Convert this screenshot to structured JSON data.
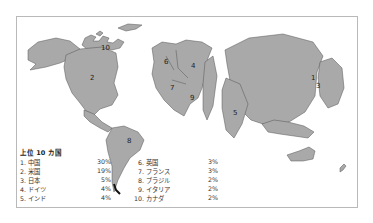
{
  "map": {
    "type": "cartogram",
    "fill_color": "#a9a9a9",
    "border_color": "#b9b9b9",
    "region_labels": [
      {
        "rank": "1",
        "country": "中国"
      },
      {
        "rank": "2",
        "country": "米国"
      },
      {
        "rank": "3",
        "country": "日本"
      },
      {
        "rank": "4",
        "country": "ドイツ"
      },
      {
        "rank": "5",
        "country": "インド"
      },
      {
        "rank": "6",
        "country": "英国"
      },
      {
        "rank": "7",
        "country": "フランス"
      },
      {
        "rank": "8",
        "country": "ブラジル"
      },
      {
        "rank": "9",
        "country": "イタリア"
      },
      {
        "rank": "10",
        "country": "カナダ"
      }
    ]
  },
  "legend": {
    "title": "上位 10 カ国",
    "left": [
      {
        "label": "1.  中国",
        "pct": "30%"
      },
      {
        "label": "2.  米国",
        "pct": "19%"
      },
      {
        "label": "3.  日本",
        "pct": "5%"
      },
      {
        "label": "4.  ドイツ",
        "pct": "4%"
      },
      {
        "label": "5.  インド",
        "pct": "4%"
      }
    ],
    "right": [
      {
        "label": "6.  英国",
        "pct": "3%"
      },
      {
        "label": "7.  フランス",
        "pct": "3%"
      },
      {
        "label": "8.  ブラジル",
        "pct": "2%"
      },
      {
        "label": "9.  イタリア",
        "pct": "2%"
      },
      {
        "label": "10.  カナダ",
        "pct": "2%"
      }
    ]
  }
}
